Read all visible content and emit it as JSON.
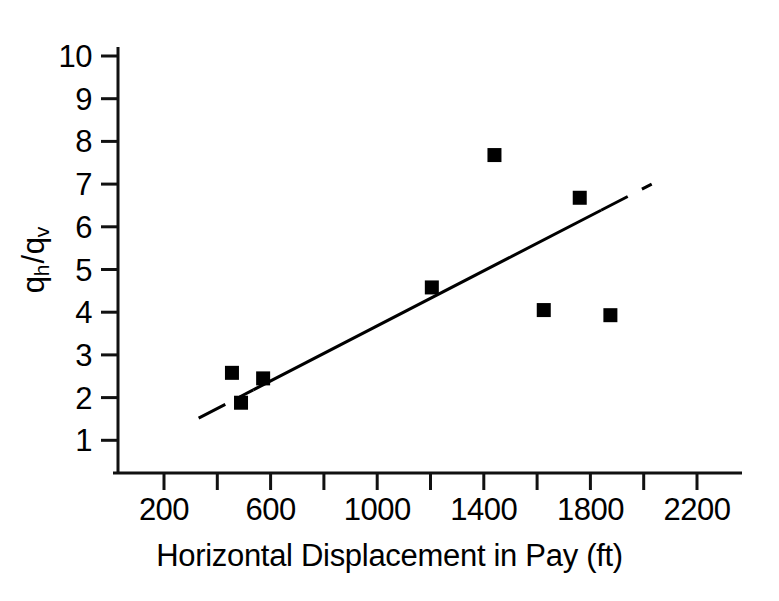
{
  "chart_data": {
    "type": "scatter",
    "title": "",
    "subtitle": "",
    "xlabel": "Horizontal Displacement in Pay (ft)",
    "ylabel": "qh/qv",
    "ylabel_parts": {
      "q1": "q",
      "sub1": "h",
      "slash": "/",
      "q2": "q",
      "sub2": "v"
    },
    "xlim": [
      100,
      2350
    ],
    "ylim": [
      0.35,
      10
    ],
    "grid": false,
    "legend": "none",
    "x_tick_step_minor": 200,
    "x_ticks_labeled": [
      200,
      600,
      1000,
      1400,
      1800,
      2200
    ],
    "x_ticks_all": [
      200,
      400,
      600,
      800,
      1000,
      1200,
      1400,
      1600,
      1800,
      2000,
      2200
    ],
    "x_tick_labels": [
      "200",
      "600",
      "1000",
      "1400",
      "1800",
      "2200"
    ],
    "y_ticks": [
      1,
      2,
      3,
      4,
      5,
      6,
      7,
      8,
      9,
      10
    ],
    "y_tick_labels": [
      "1",
      "2",
      "3",
      "4",
      "5",
      "6",
      "7",
      "8",
      "9",
      "10"
    ],
    "series": [
      {
        "name": "Data",
        "marker": "filled-square",
        "color": "#000000",
        "points": [
          {
            "x": 455,
            "y": 2.58
          },
          {
            "x": 489,
            "y": 1.88
          },
          {
            "x": 572,
            "y": 2.45
          },
          {
            "x": 1205,
            "y": 4.58
          },
          {
            "x": 1440,
            "y": 7.68
          },
          {
            "x": 1625,
            "y": 4.05
          },
          {
            "x": 1760,
            "y": 6.68
          },
          {
            "x": 1875,
            "y": 3.93
          }
        ]
      }
    ],
    "trendline": {
      "name": "Linear fit",
      "style": "solid-with-dashed-extensions",
      "color": "#000000",
      "x_start": 330,
      "y_start": 1.52,
      "x_end": 2030,
      "y_end": 7.0,
      "solid_x_start": 535,
      "solid_x_end": 1840,
      "slope_per_1000ft": 3.22
    },
    "annotations": []
  },
  "axes": {
    "axis_color": "#111111",
    "spine_left": true,
    "spine_bottom": true,
    "tick_direction": "out"
  }
}
